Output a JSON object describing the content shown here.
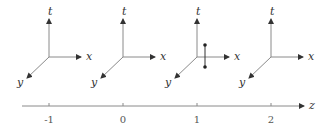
{
  "frames": [
    {
      "z_value": "-1",
      "origin": [
        49,
        57
      ],
      "axes": {
        "t": "t",
        "x": "x",
        "y": "y"
      }
    },
    {
      "z_value": "0",
      "origin": [
        123,
        57
      ],
      "axes": {
        "t": "t",
        "x": "x",
        "y": "y"
      }
    },
    {
      "z_value": "1",
      "origin": [
        197,
        57
      ],
      "axes": {
        "t": "t",
        "x": "x",
        "y": "y"
      },
      "marked_segment": {
        "x_offset": 8,
        "top_offset": -12,
        "bottom_offset": 10
      }
    },
    {
      "z_value": "2",
      "origin": [
        271,
        57
      ],
      "axes": {
        "t": "t",
        "x": "x",
        "y": "y"
      }
    }
  ],
  "z_axis": {
    "label": "z",
    "ticks": [
      "-1",
      "0",
      "1",
      "2"
    ]
  },
  "colors": {
    "line": "#8a8a8a",
    "arrow": "#333333",
    "text": "#333333"
  }
}
